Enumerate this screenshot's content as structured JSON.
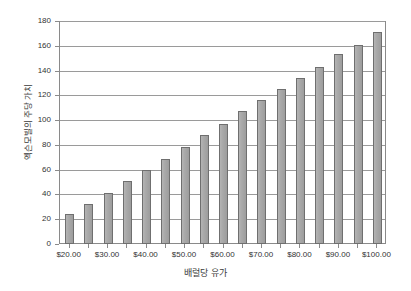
{
  "chart_data": {
    "type": "bar",
    "title": "",
    "subtitle": "",
    "xlabel": "배럴당 유가",
    "ylabel": "엑슨모빌의 주당 가치",
    "categories": [
      "$20.00",
      "$25.00",
      "$30.00",
      "$35.00",
      "$40.00",
      "$45.00",
      "$50.00",
      "$55.00",
      "$60.00",
      "$65.00",
      "$70.00",
      "$75.00",
      "$80.00",
      "$85.00",
      "$90.00",
      "$95.00",
      "$100.00"
    ],
    "values": [
      24,
      32,
      41,
      51,
      60,
      69,
      78,
      88,
      97,
      107,
      116,
      125,
      134,
      143,
      153,
      161,
      171
    ],
    "ylim": [
      0,
      180
    ],
    "y_tick_step": 20,
    "y_ticks": [
      0,
      20,
      40,
      60,
      80,
      100,
      120,
      140,
      160,
      180
    ],
    "x_tick_labels": [
      "$20.00",
      "$30.00",
      "$40.00",
      "$50.00",
      "$60.00",
      "$70.00",
      "$80.00",
      "$90.00",
      "$100.00"
    ],
    "x_tick_label_interval": 2,
    "grid": true,
    "grid_axis": "y",
    "legend": null,
    "legend_position": "none",
    "bar_color": "#a8a8a8",
    "bar_border_color": "#6f6f6f",
    "axis_color": "#8a8a8a",
    "grid_color": "#9a9a9a",
    "background": "#ffffff"
  }
}
